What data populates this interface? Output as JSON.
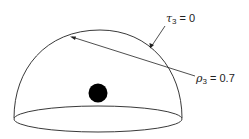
{
  "diagram": {
    "type": "hemisphere",
    "labels": {
      "tau": {
        "symbol": "τ",
        "subscript": "3",
        "equals": "= 0"
      },
      "rho": {
        "symbol": "ρ",
        "subscript": "3",
        "equals": "= 0.7"
      }
    },
    "colors": {
      "stroke": "#222222",
      "dot": "#000000",
      "background": "#ffffff"
    }
  }
}
